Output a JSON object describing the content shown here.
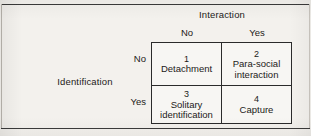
{
  "figure": {
    "type": "two-by-two-matrix",
    "column_dimension": {
      "title": "Interaction",
      "levels": [
        "No",
        "Yes"
      ]
    },
    "row_dimension": {
      "title": "Identification",
      "levels": [
        "No",
        "Yes"
      ]
    },
    "cells": [
      {
        "number": "1",
        "label": "Detachment",
        "row": "No",
        "column": "No"
      },
      {
        "number": "2",
        "label": "Para-social\ninteraction",
        "row": "No",
        "column": "Yes"
      },
      {
        "number": "3",
        "label": "Solitary\nidentification",
        "row": "Yes",
        "column": "No"
      },
      {
        "number": "4",
        "label": "Capture",
        "row": "Yes",
        "column": "Yes"
      }
    ]
  },
  "colors": {
    "page_background": "#f3f1ed",
    "cell_background": "#f7f6f3",
    "text": "#1c1a18",
    "table_border": "#2b2b2b",
    "rule": "#3a3a3a"
  }
}
